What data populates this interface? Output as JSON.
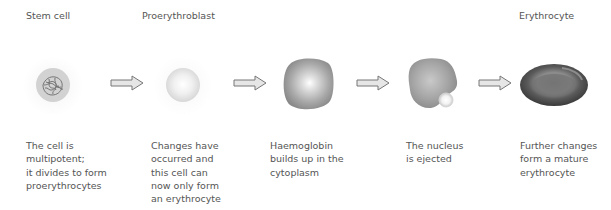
{
  "stages": [
    {
      "title": "Stem cell",
      "description": "The cell is\nmultipotent;\nit divides to form\nproerythrocytes",
      "cell": "stem-cell"
    },
    {
      "title": "Proerythroblast",
      "description": "Changes have\noccurred and\nthis cell can\nnow only form\nan erythrocyte",
      "cell": "proerythroblast"
    },
    {
      "title": "",
      "description": "Haemoglobin\nbuilds up in the\ncytoplasm",
      "cell": "haemoglobin-cell"
    },
    {
      "title": "",
      "description": "The nucleus\nis ejected",
      "cell": "nucleus-ejecting-cell"
    },
    {
      "title": "Erythrocyte",
      "description": "Further changes\nform a mature\nerythrocyte",
      "cell": "erythrocyte"
    }
  ],
  "arrows": [
    "right-arrow",
    "right-arrow",
    "right-arrow",
    "right-arrow"
  ],
  "colors": {
    "text": "#555555",
    "arrow_fill": "#e6e6e6",
    "arrow_stroke": "#777777",
    "cell_gray": "#9a9a9a",
    "erythrocyte_dark": "#4a4a4a"
  }
}
